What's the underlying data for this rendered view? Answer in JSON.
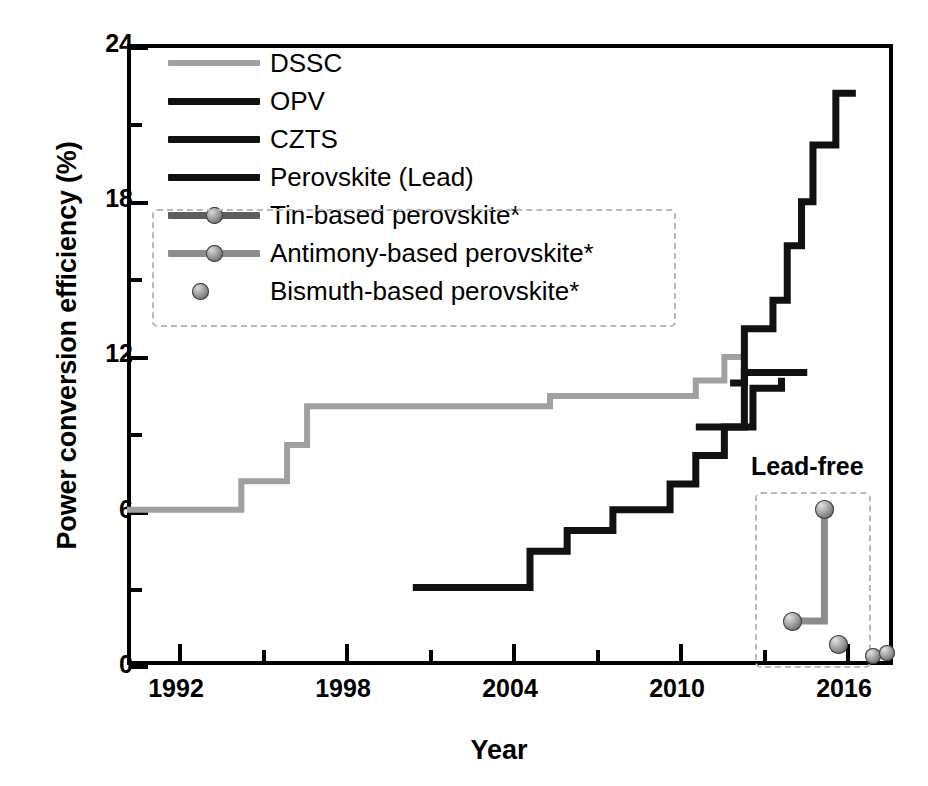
{
  "chart_data": {
    "type": "line",
    "title": "",
    "xlabel": "Year",
    "ylabel": "Power conversion efficiency (%)",
    "xlim": [
      1991,
      2017.8
    ],
    "ylim": [
      0,
      24
    ],
    "xticks": [
      1992,
      1998,
      2004,
      2010,
      2016
    ],
    "xticks_minor": [
      1995,
      2001,
      2007,
      2013
    ],
    "yticks": [
      0,
      6,
      12,
      18,
      24
    ],
    "yticks_minor": [
      3,
      9,
      15,
      21
    ],
    "grid": false,
    "legend_position": "upper-left-inside",
    "step_style": "post",
    "series": [
      {
        "name": "DSSC",
        "style": "step-line",
        "color": "#a0a0a0",
        "points": [
          {
            "x": 1991.0,
            "y": 6.0
          },
          {
            "x": 1995.0,
            "y": 7.1
          },
          {
            "x": 1996.6,
            "y": 8.5
          },
          {
            "x": 1997.3,
            "y": 10.0
          },
          {
            "x": 2005.8,
            "y": 10.4
          },
          {
            "x": 2010.9,
            "y": 11.0
          },
          {
            "x": 2011.9,
            "y": 11.9
          },
          {
            "x": 2012.6,
            "y": 11.9
          }
        ]
      },
      {
        "name": "OPV",
        "style": "step-line",
        "color": "#111111",
        "points": [
          {
            "x": 2001.0,
            "y": 3.0
          },
          {
            "x": 2003.1,
            "y": 3.0
          },
          {
            "x": 2005.1,
            "y": 4.4
          },
          {
            "x": 2006.4,
            "y": 5.2
          },
          {
            "x": 2008.0,
            "y": 6.0
          },
          {
            "x": 2010.0,
            "y": 7.0
          },
          {
            "x": 2010.9,
            "y": 8.1
          },
          {
            "x": 2011.9,
            "y": 9.2
          },
          {
            "x": 2012.9,
            "y": 10.7
          },
          {
            "x": 2013.9,
            "y": 11.1
          }
        ]
      },
      {
        "name": "CZTS",
        "style": "step-line",
        "color": "#111111",
        "points": [
          {
            "x": 2010.9,
            "y": 9.2
          },
          {
            "x": 2012.3,
            "y": 9.2
          },
          {
            "x": 2012.6,
            "y": 11.3
          },
          {
            "x": 2013.2,
            "y": 11.3
          },
          {
            "x": 2014.8,
            "y": 11.3
          }
        ]
      },
      {
        "name": "Perovskite (Lead)",
        "style": "step-line",
        "color": "#111111",
        "points": [
          {
            "x": 2012.1,
            "y": 10.9
          },
          {
            "x": 2012.6,
            "y": 13.0
          },
          {
            "x": 2013.6,
            "y": 14.1
          },
          {
            "x": 2014.1,
            "y": 16.2
          },
          {
            "x": 2014.6,
            "y": 17.9
          },
          {
            "x": 2015.0,
            "y": 20.1
          },
          {
            "x": 2015.8,
            "y": 22.1
          },
          {
            "x": 2016.5,
            "y": 22.1
          }
        ]
      },
      {
        "name": "Tin-based perovskite*",
        "style": "step-line-markers",
        "color": "#8c8c8c",
        "points": [
          {
            "x": 2014.3,
            "y": 1.7
          },
          {
            "x": 2015.4,
            "y": 6.0
          }
        ]
      },
      {
        "name": "Antimony-based perovskite*",
        "style": "markers",
        "color": "#8c8c8c",
        "points": [
          {
            "x": 2015.9,
            "y": 0.8
          }
        ]
      },
      {
        "name": "Bismuth-based perovskite*",
        "style": "markers",
        "color": "#8c8c8c",
        "points": [
          {
            "x": 2017.1,
            "y": 0.35
          },
          {
            "x": 2017.6,
            "y": 0.45
          }
        ]
      }
    ],
    "annotations": [
      {
        "text": "Lead-free",
        "x": 2015.4,
        "y": 8.6
      }
    ]
  },
  "axes": {
    "ylabel": "Power conversion efficiency (%)",
    "xlabel": "Year",
    "yticks": [
      {
        "value": 24,
        "label": "24"
      },
      {
        "value": 18,
        "label": "18"
      },
      {
        "value": 12,
        "label": "12"
      },
      {
        "value": 6,
        "label": "6"
      },
      {
        "value": 0,
        "label": "0"
      }
    ],
    "xticks": [
      {
        "value": 1992,
        "label": "1992"
      },
      {
        "value": 1998,
        "label": "1998"
      },
      {
        "value": 2004,
        "label": "2004"
      },
      {
        "value": 2010,
        "label": "2010"
      },
      {
        "value": 2016,
        "label": "2016"
      }
    ]
  },
  "legend": {
    "items": [
      {
        "label": "DSSC",
        "key": "line",
        "color": "#a0a0a0",
        "boxed": false
      },
      {
        "label": "OPV",
        "key": "line",
        "color": "#111111",
        "boxed": false
      },
      {
        "label": "CZTS",
        "key": "line",
        "color": "#111111",
        "boxed": false
      },
      {
        "label": "Perovskite (Lead)",
        "key": "line",
        "color": "#111111",
        "boxed": false
      },
      {
        "label": "Tin-based perovskite*",
        "key": "line-marker",
        "color": "#6e6e6e",
        "boxed": true
      },
      {
        "label": "Antimony-based perovskite*",
        "key": "line-marker",
        "color": "#8c8c8c",
        "boxed": true
      },
      {
        "label": "Bismuth-based perovskite*",
        "key": "marker",
        "color": "#6e6e6e",
        "boxed": true
      }
    ]
  },
  "annotations": {
    "lead_free": "Lead-free"
  },
  "colors": {
    "dssc": "#a0a0a0",
    "opv": "#111111",
    "czts": "#111111",
    "perovskite_lead": "#111111",
    "lead_free_gray": "#8c8c8c",
    "axis": "#000000",
    "dash_box": "#b9b9b9"
  }
}
